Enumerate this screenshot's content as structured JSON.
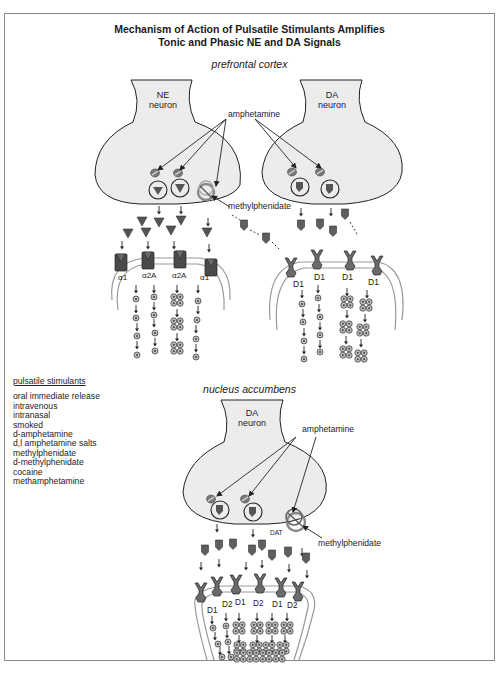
{
  "title": {
    "line1": "Mechanism of Action of Pulsatile Stimulants Amplifies",
    "line2": "Tonic and Phasic NE and DA Signals"
  },
  "regions": {
    "top": "prefrontal cortex",
    "bottom": "nucleus accumbens"
  },
  "neurons": {
    "ne": {
      "line1": "NE",
      "line2": "neuron"
    },
    "da_pfc": {
      "line1": "DA",
      "line2": "neuron"
    },
    "da_nac": {
      "line1": "DA",
      "line2": "neuron"
    }
  },
  "drug_labels": {
    "amphetamine_pfc": "amphetamine",
    "methylphenidate_pfc": "methylphenidate",
    "amphetamine_nac": "amphetamine",
    "methylphenidate_nac": "methylphenidate",
    "dat": "DAT"
  },
  "receptors": {
    "ne_pfc": [
      "α1",
      "α2A",
      "α2A",
      "α1"
    ],
    "da_pfc": [
      "D1",
      "D1",
      "D1",
      "D1"
    ],
    "da_nac": [
      "D1",
      "D2",
      "D1",
      "D2",
      "D1",
      "D2"
    ]
  },
  "legend": {
    "heading": "pulsatile stimulants",
    "items": [
      "oral immediate release",
      "intravenous",
      "intranasal",
      "smoked",
      "d-amphetamine",
      "d,l amphetamine salts",
      "methylphenidate",
      "d-methylphenidate",
      "cocaine",
      "methamphetamine"
    ]
  },
  "colors": {
    "neuron_fill": "#ececec",
    "transmitter": "#5a5a5a",
    "receptor": "#4a4a4a",
    "membrane": "#9a9a9a",
    "transporter_ring": "#888888"
  }
}
